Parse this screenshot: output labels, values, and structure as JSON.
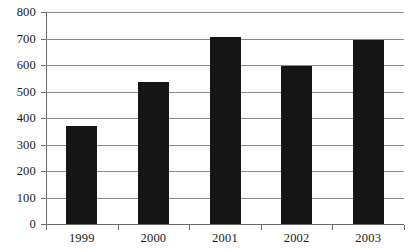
{
  "chart_data": {
    "type": "bar",
    "title": "",
    "subtitle": "",
    "xlabel": "",
    "ylabel": "",
    "categories": [
      "1999",
      "2000",
      "2001",
      "2002",
      "2003"
    ],
    "values": [
      370,
      535,
      705,
      595,
      695
    ],
    "series": [
      {
        "name": "",
        "values": [
          370,
          535,
          705,
          595,
          695
        ]
      }
    ],
    "ylim": [
      0,
      800
    ],
    "y_ticks": [
      0,
      100,
      200,
      300,
      400,
      500,
      600,
      700,
      800
    ],
    "y_tick_labels": [
      "0",
      "100",
      "200",
      "300",
      "400",
      "500",
      "600",
      "700",
      "800"
    ],
    "x_tick_labels": [
      "1999",
      "2000",
      "2001",
      "2002",
      "2003"
    ],
    "grid": true,
    "grid_axis": "y",
    "legend": false,
    "legend_position": "none",
    "annotations": [],
    "colors": {
      "bar_fill": "#151515",
      "gridline": "#8a8a8a",
      "axis_line": "#6a6a6a",
      "background": "#ffffff",
      "text": "#1a1a1a"
    }
  }
}
